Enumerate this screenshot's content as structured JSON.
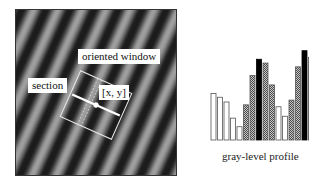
{
  "figure": {
    "labels": {
      "oriented_window": "oriented window",
      "section": "section",
      "center": "[x, y]"
    },
    "caption": "gray-level profile"
  },
  "colors": {
    "stripe_dark": "#1e1e1e",
    "stripe_light": "#a8a8a8",
    "window_outline": "#e8e8e8",
    "bar_white": "#ffffff",
    "bar_checker": "#7a7a7a",
    "bar_black": "#000000"
  },
  "chart_data": {
    "type": "bar",
    "title": "gray-level profile",
    "xlabel": "",
    "ylabel": "",
    "categories": [
      "1",
      "2",
      "3",
      "4",
      "5",
      "6",
      "7",
      "8",
      "9",
      "10",
      "11",
      "12",
      "13",
      "14",
      "15",
      "16"
    ],
    "values": [
      49,
      45,
      40,
      23,
      14,
      37,
      68,
      85,
      81,
      58,
      35,
      25,
      42,
      77,
      94,
      87
    ],
    "fills": [
      "white",
      "white",
      "white",
      "white",
      "white",
      "checker",
      "checker",
      "black",
      "checker",
      "checker",
      "white",
      "white",
      "checker",
      "checker",
      "black",
      "checker"
    ],
    "ylim": [
      0,
      100
    ],
    "grid": false,
    "legend": "none"
  }
}
